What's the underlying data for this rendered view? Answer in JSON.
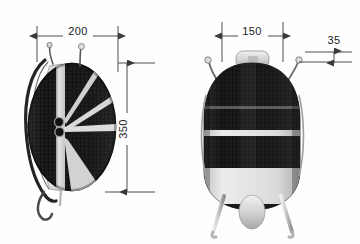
{
  "drawing": {
    "title": "Backpack sprayer dimension drawing",
    "background_color": "#fefefe",
    "line_color": "#3a3a3a",
    "text_color": "#1a1a1a",
    "body_dark_color": "#1b1b1b",
    "body_light_color": "#d9d9d9",
    "strap_color": "#2a2a2a",
    "units_note": "",
    "views": [
      {
        "name": "side-view",
        "label": "",
        "dimensions": [
          {
            "name": "width-200",
            "value": "200",
            "orientation": "horizontal"
          },
          {
            "name": "height-350",
            "value": "350",
            "orientation": "vertical"
          }
        ]
      },
      {
        "name": "front-view",
        "label": "",
        "dimensions": [
          {
            "name": "width-150",
            "value": "150",
            "orientation": "horizontal"
          },
          {
            "name": "offset-35",
            "value": "35",
            "orientation": "horizontal"
          }
        ]
      }
    ]
  },
  "dimension_labels": {
    "d200": "200",
    "d350": "350",
    "d150": "150",
    "d35": "35"
  }
}
